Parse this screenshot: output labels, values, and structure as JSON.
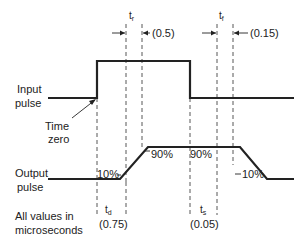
{
  "labels": {
    "input_line1": "Input",
    "input_line2": "pulse",
    "output_line1": "Output",
    "output_line2": "pulse",
    "time_zero_line1": "Time",
    "time_zero_line2": "zero",
    "units_line1": "All values in",
    "units_line2": "microseconds"
  },
  "timing": {
    "rise": {
      "symbol": "t",
      "subscript": "r",
      "value": "(0.5)"
    },
    "fall": {
      "symbol": "t",
      "subscript": "f",
      "value": "(0.15)"
    },
    "delay": {
      "symbol": "t",
      "subscript": "d",
      "value": "(0.75)"
    },
    "storage": {
      "symbol": "t",
      "subscript": "s",
      "value": "(0.05)"
    }
  },
  "levels": {
    "rise_low": "10%",
    "rise_high": "90%",
    "fall_high": "90%",
    "fall_low": "10%"
  },
  "colors": {
    "line": "#222222",
    "dashed": "#444444",
    "background": "#ffffff"
  }
}
